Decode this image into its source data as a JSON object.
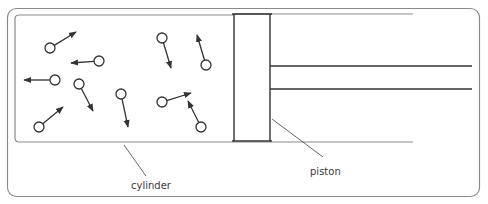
{
  "diagram": {
    "title": "",
    "colors": {
      "frame": "#8a8a8a",
      "line": "#333333",
      "leader": "#555555",
      "text": "#3a3a3a",
      "background": "#ffffff"
    },
    "labels": {
      "cylinder": "cylinder",
      "piston": "piston"
    },
    "molecules": [
      {
        "cx": 50,
        "cy": 48,
        "tx": 76,
        "ty": 32
      },
      {
        "cx": 99,
        "cy": 61,
        "tx": 71,
        "ty": 63
      },
      {
        "cx": 55,
        "cy": 80,
        "tx": 24,
        "ty": 80
      },
      {
        "cx": 79,
        "cy": 84,
        "tx": 93,
        "ty": 111
      },
      {
        "cx": 121,
        "cy": 94,
        "tx": 128,
        "ty": 127
      },
      {
        "cx": 39,
        "cy": 127,
        "tx": 63,
        "ty": 107
      },
      {
        "cx": 162,
        "cy": 38,
        "tx": 171,
        "ty": 68
      },
      {
        "cx": 206,
        "cy": 65,
        "tx": 197,
        "ty": 35
      },
      {
        "cx": 162,
        "cy": 102,
        "tx": 191,
        "ty": 93
      },
      {
        "cx": 201,
        "cy": 127,
        "tx": 188,
        "ty": 101
      }
    ]
  }
}
